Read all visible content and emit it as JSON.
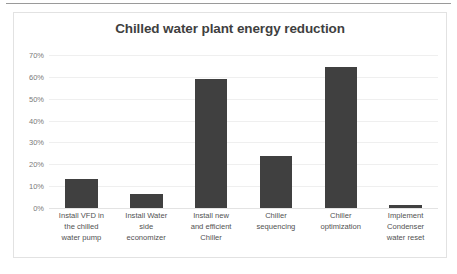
{
  "page": {
    "background_color": "#ffffff",
    "top_rule_color": "#9a9a9a"
  },
  "chart_frame": {
    "border_color": "#e2e2e2"
  },
  "chart_data": {
    "type": "bar",
    "title": "Chilled water plant energy reduction",
    "xlabel": "",
    "ylabel": "",
    "ylim": [
      0,
      0.7
    ],
    "grid": true,
    "legend": "none",
    "bar_color": "#404040",
    "gridline_color": "#efefef",
    "axis_label_color": "#7a7a7a",
    "title_color": "#3f3f3f",
    "ytick_labels": [
      "70%",
      "60%",
      "50%",
      "40%",
      "30%",
      "20%",
      "10%",
      "0%"
    ],
    "ytick_values": [
      0.7,
      0.6,
      0.5,
      0.4,
      0.3,
      0.2,
      0.1,
      0.0
    ],
    "categories": [
      "Install VFD in\nthe chilled\nwater pump",
      "Install Water\nside\neconomizer",
      "Install new\nand efficient\nChiller",
      "Chiller\nsequencing",
      "Chiller\noptimization",
      "Implement\nCondenser\nwater reset"
    ],
    "values": [
      0.135,
      0.065,
      0.59,
      0.24,
      0.645,
      0.015
    ]
  }
}
